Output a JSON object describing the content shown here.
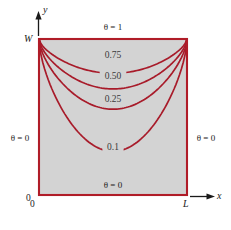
{
  "figure": {
    "type": "contour-diagram",
    "colors": {
      "plate_fill": "#d3d3d3",
      "boundary": "#b01c28",
      "contour": "#a81b2a",
      "text": "#1a1a1a",
      "background": "#ffffff"
    },
    "axes": {
      "x_label": "x",
      "y_label": "y",
      "origin_label": "0",
      "origin_label_secondary": "0",
      "x_max_label": "L",
      "y_max_label": "W"
    },
    "boundary_conditions": {
      "top": "θ = 1",
      "left": "θ = 0",
      "right": "θ = 0",
      "bottom": "θ = 0"
    },
    "contours": [
      {
        "label": "0.75",
        "value": 0.75,
        "label_x": 113,
        "label_y": 58,
        "vertex_depth": 0.22
      },
      {
        "label": "0.50",
        "value": 0.5,
        "label_x": 113,
        "label_y": 79,
        "vertex_depth": 0.32
      },
      {
        "label": "0.25",
        "value": 0.25,
        "label_x": 113,
        "label_y": 102,
        "vertex_depth": 0.45
      },
      {
        "label": "0.1",
        "value": 0.1,
        "label_x": 113,
        "label_y": 150,
        "vertex_depth": 0.72
      }
    ]
  },
  "chart_data": {
    "type": "line",
    "title": "",
    "xlabel": "x",
    "ylabel": "y",
    "xlim": [
      0,
      1
    ],
    "ylim": [
      0,
      1
    ],
    "xticklabels": [
      "0",
      "L"
    ],
    "yticklabels": [
      "0",
      "W"
    ],
    "grid": false,
    "legend": "none",
    "annotations": [
      "θ = 1",
      "θ = 0",
      "θ = 0",
      "θ = 0",
      "0.75",
      "0.50",
      "0.25",
      "0.1"
    ],
    "series": [
      {
        "name": "0.75",
        "values": [
          1.0,
          0.84,
          0.8,
          0.78,
          0.78,
          0.8,
          0.84,
          1.0
        ]
      },
      {
        "name": "0.50",
        "values": [
          1.0,
          0.76,
          0.7,
          0.68,
          0.68,
          0.7,
          0.76,
          1.0
        ]
      },
      {
        "name": "0.25",
        "values": [
          1.0,
          0.66,
          0.58,
          0.55,
          0.55,
          0.58,
          0.66,
          1.0
        ]
      },
      {
        "name": "0.1",
        "values": [
          1.0,
          0.46,
          0.33,
          0.28,
          0.28,
          0.33,
          0.46,
          1.0
        ]
      }
    ],
    "x": [
      0.0,
      0.12,
      0.28,
      0.45,
      0.55,
      0.72,
      0.88,
      1.0
    ]
  }
}
